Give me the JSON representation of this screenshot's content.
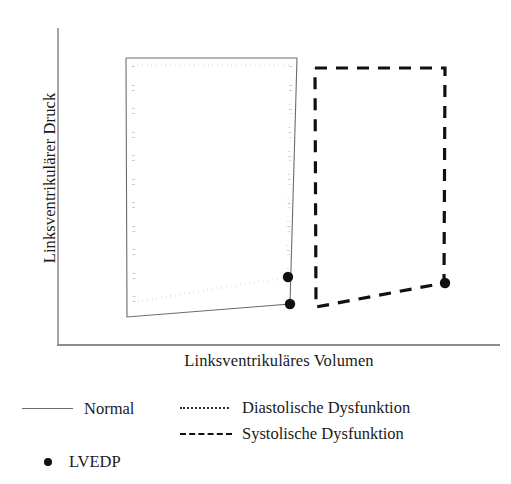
{
  "figure": {
    "title": "",
    "background_color": "#ffffff",
    "axes": {
      "y_label": "Linksventrikulärer Druck",
      "x_label": "Linksventrikuläres Volumen",
      "axis_color": "#8c8c8c",
      "origin_x": 58,
      "origin_y": 345,
      "x_axis_end": 500,
      "y_axis_top": 28
    },
    "legend": {
      "rows": [
        {
          "key": "normal",
          "label": "Normal",
          "style": "solid",
          "color": "#6b6b6b",
          "swatch_x": 22,
          "swatch_y": 408,
          "swatch_w": 51,
          "label_x": 84,
          "label_y": 396
        },
        {
          "key": "diastolic",
          "label": "Diastolische Dysfunktion",
          "style": "dotted",
          "color": "#333333",
          "swatch_x": 180,
          "swatch_y": 407,
          "swatch_w": 49,
          "label_x": 242,
          "label_y": 395
        },
        {
          "key": "systolic",
          "label": "Systolische Dysfunktion",
          "style": "dashed",
          "color": "#111111",
          "swatch_x": 180,
          "swatch_y": 433,
          "swatch_w": 52,
          "label_x": 242,
          "label_y": 421
        },
        {
          "key": "lvedp",
          "label": "LVEDP",
          "style": "marker",
          "color": "#111111",
          "swatch_x": 44,
          "swatch_y": 458,
          "swatch_w": 8,
          "label_x": 69,
          "label_y": 449
        }
      ]
    }
  },
  "chart_data": {
    "type": "line",
    "title": "",
    "xlabel": "Linksventrikuläres Volumen",
    "ylabel": "Linksventrikulärer Druck",
    "x_axis_ticks": [],
    "y_axis_ticks": [],
    "grid": false,
    "legend_position": "bottom",
    "note": "Pressure-volume loops: Normal, Diastolische Dysfunktion, Systolische Dysfunktion with LVEDP markers",
    "series": [
      {
        "name": "Normal",
        "style": "solid",
        "color": "#6b6b6b",
        "line_width": 1.1,
        "points": [
          [
            126,
            58
          ],
          [
            297,
            58
          ],
          [
            290,
            304
          ],
          [
            127,
            317
          ],
          [
            126,
            58
          ]
        ]
      },
      {
        "name": "Diastolische Dysfunktion",
        "style": "dotted",
        "color": "#333333",
        "line_width": 3.0,
        "points": [
          [
            133,
            65
          ],
          [
            291,
            65
          ],
          [
            288,
            277
          ],
          [
            134,
            302
          ],
          [
            133,
            65
          ]
        ]
      },
      {
        "name": "Systolische Dysfunktion",
        "style": "dashed",
        "color": "#111111",
        "line_width": 3.2,
        "points": [
          [
            315,
            68
          ],
          [
            445,
            68
          ],
          [
            444,
            283
          ],
          [
            316,
            307
          ],
          [
            315,
            68
          ]
        ]
      }
    ],
    "markers": [
      {
        "name": "LVEDP",
        "series": "Diastolische Dysfunktion",
        "x": 288,
        "y": 277,
        "radius": 5.2,
        "color": "#111111"
      },
      {
        "name": "LVEDP",
        "series": "Normal",
        "x": 290,
        "y": 304,
        "radius": 5.2,
        "color": "#111111"
      },
      {
        "name": "LVEDP",
        "series": "Systolische Dysfunktion",
        "x": 445,
        "y": 283,
        "radius": 5.2,
        "color": "#111111"
      }
    ]
  }
}
